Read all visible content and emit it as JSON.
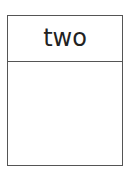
{
  "diagram": {
    "box": {
      "title": "two",
      "border_color": "#555555",
      "text_color": "#222222"
    }
  }
}
